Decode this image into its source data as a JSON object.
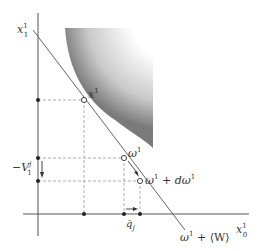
{
  "diagram": {
    "labels": {
      "y_axis": "x",
      "y_axis_sup": "1",
      "y_axis_sub": "1",
      "x_axis": "x",
      "x_axis_sup": "1",
      "x_axis_sub": "0",
      "point_x": "x",
      "point_x_sup": "1",
      "point_omega": "ω",
      "point_omega_sup": "1",
      "point_omega_d": "ω",
      "point_omega_d_sup": "1",
      "point_omega_d_rest": " + dω",
      "point_omega_d_rest_sup": "1",
      "neg_v": "−V",
      "neg_v_sup": "j",
      "neg_v_sub": "1",
      "q_bar": "q̄",
      "q_bar_sub": "j",
      "budget_line": "ω",
      "budget_line_sup": "1",
      "budget_line_rest": " + ⟨W⟩"
    },
    "colors": {
      "axis": "#555555",
      "line": "#666666",
      "dashed": "#999999",
      "shade_dark": "#8a8a8a",
      "shade_light": "#ffffff"
    }
  }
}
